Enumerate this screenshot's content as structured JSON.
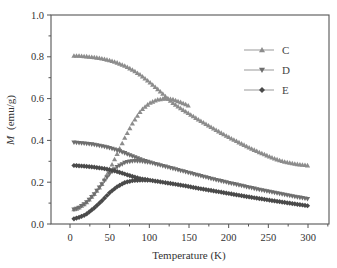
{
  "chart_data": {
    "type": "scatter",
    "title": "",
    "xlabel": "Temperature (K)",
    "ylabel_italic": "M",
    "ylabel_units": "(emu/g)",
    "ylabel": "M (emu/g)",
    "xlim": [
      -20,
      325
    ],
    "ylim": [
      0.0,
      1.0
    ],
    "x_ticks": [
      0,
      50,
      100,
      150,
      200,
      250,
      300
    ],
    "x_tick_labels": [
      "0",
      "50",
      "100",
      "150",
      "200",
      "250",
      "300"
    ],
    "y_ticks": [
      0.0,
      0.2,
      0.4,
      0.6,
      0.8,
      1.0
    ],
    "y_tick_labels": [
      "0.0",
      "0.2",
      "0.4",
      "0.6",
      "0.8",
      "1.0"
    ],
    "grid": false,
    "legend_position": "upper right",
    "legend": [
      {
        "label": "C",
        "marker": "triangle-up"
      },
      {
        "label": "D",
        "marker": "triangle-down"
      },
      {
        "label": "E",
        "marker": "diamond"
      }
    ],
    "series": [
      {
        "name": "C (FC)",
        "legend": "C",
        "marker": "triangle-up",
        "color": "#8c8c8c",
        "x": [
          5,
          10,
          20,
          30,
          40,
          50,
          60,
          70,
          80,
          90,
          100,
          110,
          120,
          130,
          140,
          150,
          160,
          170,
          180,
          190,
          200,
          210,
          220,
          230,
          240,
          250,
          260,
          270,
          280,
          290,
          300
        ],
        "y": [
          0.805,
          0.805,
          0.802,
          0.798,
          0.792,
          0.783,
          0.771,
          0.755,
          0.735,
          0.71,
          0.68,
          0.647,
          0.612,
          0.578,
          0.552,
          0.528,
          0.504,
          0.481,
          0.459,
          0.437,
          0.416,
          0.396,
          0.377,
          0.358,
          0.341,
          0.325,
          0.31,
          0.298,
          0.29,
          0.284,
          0.28
        ]
      },
      {
        "name": "C (ZFC)",
        "legend": "C",
        "marker": "triangle-up",
        "color": "#8c8c8c",
        "x": [
          5,
          10,
          20,
          30,
          40,
          50,
          60,
          70,
          80,
          90,
          100,
          110,
          120,
          130,
          140,
          150
        ],
        "y": [
          0.07,
          0.075,
          0.1,
          0.14,
          0.19,
          0.26,
          0.34,
          0.42,
          0.49,
          0.545,
          0.578,
          0.595,
          0.6,
          0.596,
          0.582,
          0.565
        ]
      },
      {
        "name": "D (FC)",
        "legend": "D",
        "marker": "triangle-down",
        "color": "#6e6e6e",
        "x": [
          5,
          10,
          20,
          30,
          40,
          50,
          60,
          70,
          80,
          90,
          100,
          120,
          140,
          160,
          180,
          200,
          220,
          240,
          260,
          280,
          300
        ],
        "y": [
          0.39,
          0.388,
          0.385,
          0.38,
          0.373,
          0.364,
          0.352,
          0.338,
          0.322,
          0.307,
          0.295,
          0.275,
          0.255,
          0.235,
          0.215,
          0.197,
          0.18,
          0.163,
          0.148,
          0.133,
          0.12
        ]
      },
      {
        "name": "D (ZFC)",
        "legend": "D",
        "marker": "triangle-down",
        "color": "#6e6e6e",
        "x": [
          5,
          10,
          20,
          30,
          40,
          50,
          60,
          70,
          80,
          90,
          100
        ],
        "y": [
          0.07,
          0.075,
          0.1,
          0.14,
          0.19,
          0.24,
          0.275,
          0.295,
          0.302,
          0.3,
          0.295
        ]
      },
      {
        "name": "E (FC)",
        "legend": "E",
        "marker": "diamond",
        "color": "#4a4a4a",
        "x": [
          5,
          10,
          20,
          30,
          40,
          50,
          60,
          70,
          80,
          90,
          100,
          120,
          140,
          160,
          180,
          200,
          220,
          240,
          260,
          280,
          300
        ],
        "y": [
          0.28,
          0.279,
          0.276,
          0.272,
          0.267,
          0.26,
          0.25,
          0.238,
          0.226,
          0.216,
          0.21,
          0.198,
          0.186,
          0.172,
          0.159,
          0.146,
          0.133,
          0.121,
          0.109,
          0.098,
          0.087
        ]
      },
      {
        "name": "E (ZFC)",
        "legend": "E",
        "marker": "diamond",
        "color": "#4a4a4a",
        "x": [
          5,
          10,
          20,
          30,
          40,
          50,
          60,
          70,
          80,
          90,
          100
        ],
        "y": [
          0.025,
          0.03,
          0.045,
          0.075,
          0.11,
          0.15,
          0.18,
          0.2,
          0.208,
          0.21,
          0.21
        ]
      }
    ]
  }
}
